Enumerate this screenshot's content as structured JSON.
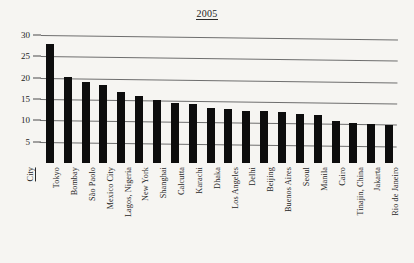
{
  "chart_data": {
    "type": "bar",
    "title": "2005",
    "xlabel": "City",
    "ylabel": "",
    "ylim": [
      0,
      30
    ],
    "yticks": [
      5,
      10,
      15,
      20,
      25,
      30
    ],
    "grid": true,
    "legend": "none",
    "categories": [
      "Tokyo",
      "Bombay",
      "São Paolo",
      "Mexico City",
      "Lagos, Nigeria",
      "New York",
      "Shanghai",
      "Calcutta",
      "Karachi",
      "Dhaka",
      "Los Angeles",
      "Delhi",
      "Beijing",
      "Buenos Aires",
      "Seoul",
      "Manila",
      "Cairo",
      "Tinajin, China",
      "Jakarta",
      "Rio de Janeiro"
    ],
    "values": [
      28.0,
      20.1,
      18.9,
      18.3,
      16.7,
      15.7,
      14.7,
      14.1,
      13.8,
      12.9,
      12.7,
      12.3,
      12.2,
      12.0,
      11.4,
      11.3,
      9.9,
      9.4,
      9.2,
      8.9
    ]
  },
  "axis": {
    "ytick_labels": [
      "30",
      "25",
      "20",
      "15",
      "10",
      "5"
    ]
  }
}
